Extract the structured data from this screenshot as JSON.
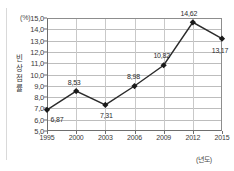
{
  "chart_data": {
    "type": "line",
    "title": "",
    "xlabel": "(년도)",
    "ylabel": "빈 상점률",
    "yunit": "(%)",
    "categories": [
      "1995",
      "2000",
      "2003",
      "2006",
      "2009",
      "2012",
      "2015"
    ],
    "values": [
      6.87,
      8.53,
      7.31,
      8.98,
      10.82,
      14.62,
      13.17
    ],
    "point_labels": [
      "6,87",
      "8,53",
      "7,31",
      "8,98",
      "10,82",
      "14,62",
      "13,17"
    ],
    "ylim": [
      5.0,
      15.0
    ],
    "yticks": [
      5.0,
      6.0,
      7.0,
      8.0,
      9.0,
      10.0,
      11.0,
      12.0,
      13.0,
      14.0,
      15.0
    ],
    "ytick_labels": [
      "5,0",
      "6,0",
      "7,0",
      "8,0",
      "9,0",
      "10,0",
      "11,0",
      "12,0",
      "13,0",
      "14,0",
      "15,0"
    ],
    "grid": true,
    "legend": false,
    "marker": "diamond",
    "line_color": "#2b2b2b",
    "marker_color": "#1a1a1a",
    "grid_color": "#bdbdbd",
    "axis_color": "#6e6e6e"
  },
  "ylabel_chars": [
    "빈",
    "상",
    "점",
    "률"
  ],
  "label_offsets": [
    {
      "dx": 10,
      "dy": 9
    },
    {
      "dx": -2,
      "dy": -9
    },
    {
      "dx": 1,
      "dy": 10
    },
    {
      "dx": -1,
      "dy": -10
    },
    {
      "dx": -2,
      "dy": -10
    },
    {
      "dx": -4,
      "dy": -9
    },
    {
      "dx": -2,
      "dy": 11
    }
  ]
}
